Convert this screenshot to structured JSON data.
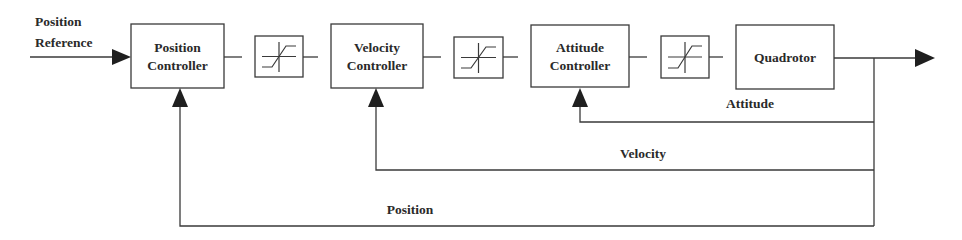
{
  "diagram": {
    "type": "control-block-diagram",
    "input": {
      "label_line1": "Position",
      "label_line2": "Reference"
    },
    "blocks": [
      {
        "id": "position-controller",
        "line1": "Position",
        "line2": "Controller"
      },
      {
        "id": "saturation-1",
        "kind": "saturation"
      },
      {
        "id": "velocity-controller",
        "line1": "Velocity",
        "line2": "Controller"
      },
      {
        "id": "saturation-2",
        "kind": "saturation"
      },
      {
        "id": "attitude-controller",
        "line1": "Attitude",
        "line2": "Controller"
      },
      {
        "id": "saturation-3",
        "kind": "saturation"
      },
      {
        "id": "quadrotor",
        "line1": "Quadrotor"
      }
    ],
    "feedback": [
      {
        "id": "attitude",
        "label": "Attitude",
        "target": "attitude-controller"
      },
      {
        "id": "velocity",
        "label": "Velocity",
        "target": "velocity-controller"
      },
      {
        "id": "position",
        "label": "Position",
        "target": "position-controller"
      }
    ],
    "colors": {
      "line": "#3a3a3a",
      "arrow": "#1f1f1f",
      "text": "#2a2a2a",
      "background": "#ffffff"
    }
  }
}
